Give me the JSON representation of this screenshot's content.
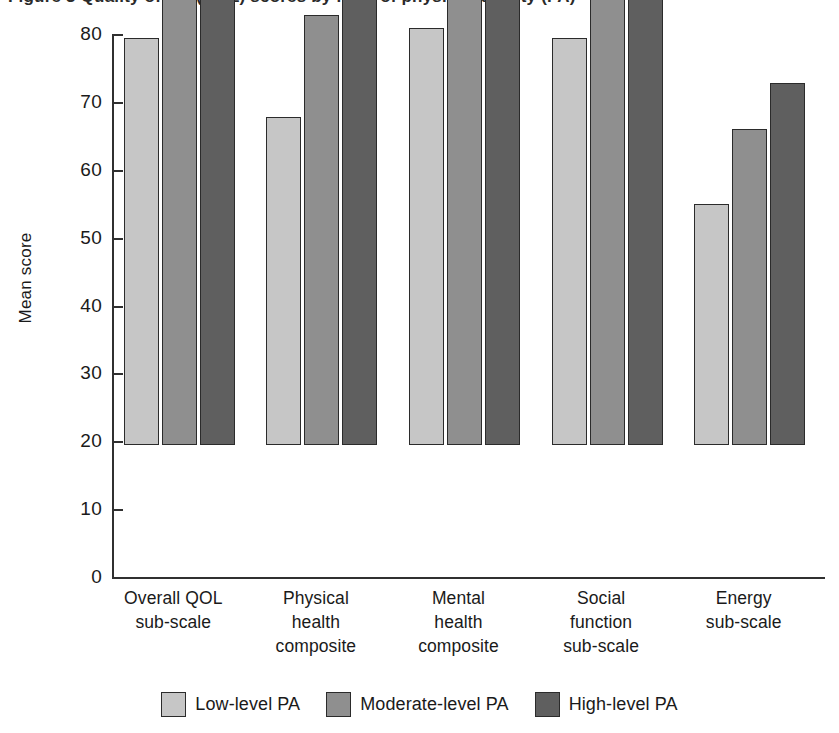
{
  "caption": {
    "text": "Figure 3  Quality of life (QOL) scores by level of physical activity (PA)"
  },
  "chart_data": {
    "type": "bar",
    "title": "",
    "xlabel": "",
    "ylabel": "Mean score",
    "ylim": [
      0,
      80
    ],
    "yticks": [
      0,
      10,
      20,
      30,
      40,
      50,
      60,
      70,
      80
    ],
    "ytick_labels": [
      "0",
      "10",
      "20",
      "30",
      "40",
      "50",
      "60",
      "70",
      "80"
    ],
    "grid": false,
    "legend_position": "bottom",
    "categories": [
      "Overall QOL\nsub-scale",
      "Physical\nhealth\ncomposite",
      "Mental\nhealth\ncomposite",
      "Social\nfunction\nsub-scale",
      "Energy\nsub-scale"
    ],
    "category_lines": [
      [
        "Overall QOL",
        "sub-scale"
      ],
      [
        "Physical",
        "health",
        "composite"
      ],
      [
        "Mental",
        "health",
        "composite"
      ],
      [
        "Social",
        "function",
        "sub-scale"
      ],
      [
        "Energy",
        "sub-scale"
      ]
    ],
    "series": [
      {
        "name": "Low-level PA",
        "color": "#c6c6c6",
        "values": [
          60.0,
          48.3,
          61.5,
          60.0,
          35.5
        ]
      },
      {
        "name": "Moderate-level PA",
        "color": "#8f8f8f",
        "values": [
          70.1,
          63.4,
          69.8,
          74.9,
          46.5
        ]
      },
      {
        "name": "High-level PA",
        "color": "#5f5f5f",
        "values": [
          74.5,
          70.3,
          72.7,
          79.4,
          53.4
        ]
      }
    ]
  },
  "axis": {
    "y_title": "Mean score"
  },
  "legend": {
    "items": [
      {
        "label": "Low-level PA",
        "color": "#c6c6c6"
      },
      {
        "label": "Moderate-level PA",
        "color": "#8f8f8f"
      },
      {
        "label": "High-level PA",
        "color": "#5f5f5f"
      }
    ]
  }
}
